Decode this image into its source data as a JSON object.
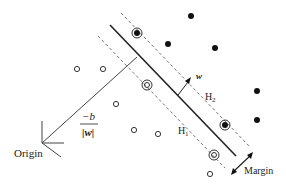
{
  "diagram": {
    "labels": {
      "origin": "Origin",
      "w": "w",
      "h1": "H",
      "h1_sub": "1",
      "h2": "H",
      "h2_sub": "2",
      "margin": "Margin",
      "offset_num": "−b",
      "offset_den": "|w|"
    },
    "colors": {
      "line": "#222222",
      "dashed": "#777777",
      "filled_point": "#111111",
      "open_point": "#333333"
    },
    "filled_points": [
      [
        191,
        16
      ],
      [
        168,
        44
      ],
      [
        215,
        48
      ],
      [
        257,
        91
      ],
      [
        257,
        120
      ]
    ],
    "open_points": [
      [
        77,
        69
      ],
      [
        103,
        69
      ],
      [
        116,
        104
      ],
      [
        134,
        130
      ],
      [
        158,
        134
      ],
      [
        210,
        174
      ]
    ],
    "support_vectors_filled": [
      [
        137,
        33
      ],
      [
        225,
        125
      ]
    ],
    "support_vectors_open": [
      [
        147,
        85
      ],
      [
        214,
        155
      ]
    ]
  }
}
